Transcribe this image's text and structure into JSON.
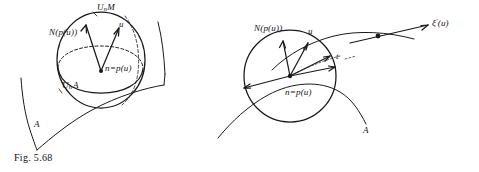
{
  "figure": {
    "caption": "Fig. 5.68",
    "number": "5.68"
  },
  "left_diagram": {
    "name": "sphere-tangent-diagram",
    "labels": {
      "sphere_top": {
        "base": "U",
        "sub": "n",
        "rest": "M"
      },
      "normal_vector": "N(p(u))",
      "tangent_vector": "u",
      "center_point": "n=p(u)",
      "equator": {
        "base": "U",
        "sub": "n",
        "rest": "A"
      },
      "surface": "A"
    }
  },
  "right_diagram": {
    "name": "circle-curve-diagram",
    "labels": {
      "normal_vector": "N(p(u))",
      "tangent_vector": "u",
      "center_point": "n=p(u)",
      "parameter": "t",
      "curve_derivative": {
        "base": "ξ",
        "prime": "′",
        "rest": "(u)"
      },
      "surface": "A"
    }
  },
  "style": {
    "ink": "#1a1a1a",
    "paper": "#ffffff"
  }
}
